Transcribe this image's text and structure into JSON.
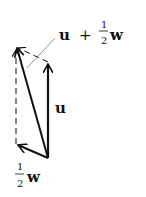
{
  "diagram": {
    "labels": {
      "sum": {
        "vec1": "u",
        "plus": "+",
        "num": "1",
        "den": "2",
        "vec2": "w"
      },
      "u": "u",
      "half_w": {
        "num": "1",
        "den": "2",
        "vec": "w"
      }
    },
    "colors": {
      "stroke": "#111111",
      "background": "#ffffff"
    }
  }
}
